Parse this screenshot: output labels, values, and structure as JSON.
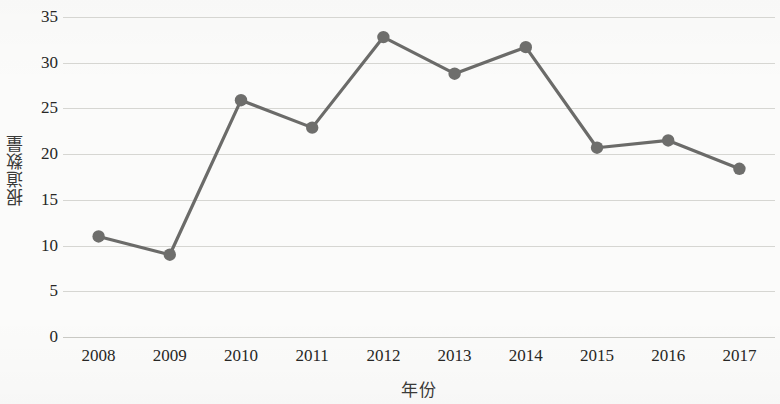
{
  "chart_data": {
    "type": "line",
    "title": "",
    "xlabel": "年份",
    "ylabel": "报道数量",
    "categories": [
      "2008",
      "2009",
      "2010",
      "2011",
      "2012",
      "2013",
      "2014",
      "2015",
      "2016",
      "2017"
    ],
    "values": [
      11.0,
      9.0,
      25.9,
      22.9,
      32.8,
      28.8,
      31.7,
      20.7,
      21.5,
      18.4
    ],
    "series": [
      {
        "name": "报道数量",
        "values": [
          11.0,
          9.0,
          25.9,
          22.9,
          32.8,
          28.8,
          31.7,
          20.7,
          21.5,
          18.4
        ]
      }
    ],
    "ylim": [
      0,
      35
    ],
    "yticks": [
      0,
      5,
      10,
      15,
      20,
      25,
      30,
      35
    ],
    "ytick_labels": [
      "0",
      "5",
      "10",
      "15",
      "20",
      "25",
      "30",
      "35"
    ],
    "grid": true,
    "grid_axis": "y",
    "legend": false,
    "legend_position": "none",
    "marker": "circle",
    "line_color": "#6b6b69",
    "marker_color": "#6e6e6c",
    "grid_color": "#d6d6d2",
    "background_color": "#fbfbfa",
    "text_color": "#272725"
  }
}
